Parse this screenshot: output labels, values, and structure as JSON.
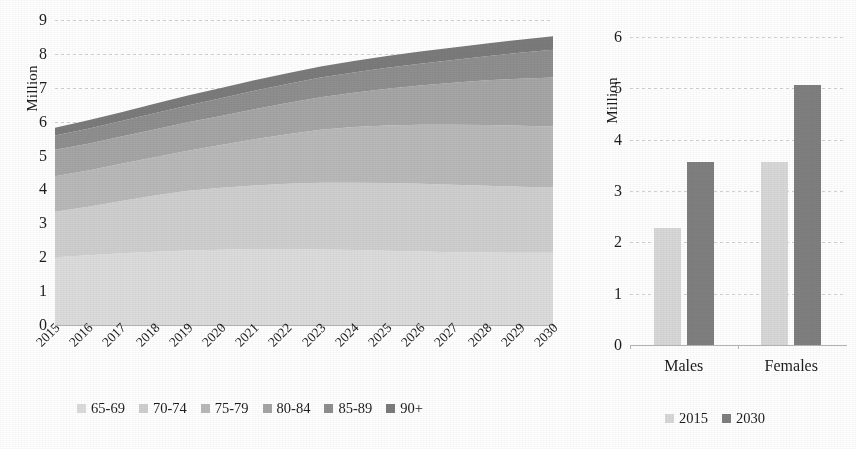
{
  "chart_data": [
    {
      "type": "area",
      "id": "stacked-area-older-population",
      "title": "",
      "xlabel": "",
      "ylabel": "Million",
      "ylim": [
        0,
        9
      ],
      "yticks": [
        0,
        1,
        2,
        3,
        4,
        5,
        6,
        7,
        8,
        9
      ],
      "grid": true,
      "legend_position": "bottom",
      "stacked": true,
      "x": [
        "2015",
        "2016",
        "2017",
        "2018",
        "2019",
        "2020",
        "2021",
        "2022",
        "2023",
        "2024",
        "2025",
        "2026",
        "2027",
        "2028",
        "2029",
        "2030"
      ],
      "series": [
        {
          "name": "65-69",
          "color": "#dcdcdc",
          "values": [
            2.0,
            2.06,
            2.12,
            2.16,
            2.2,
            2.22,
            2.24,
            2.24,
            2.23,
            2.21,
            2.19,
            2.17,
            2.15,
            2.14,
            2.13,
            2.13
          ]
        },
        {
          "name": "70-74",
          "color": "#cfcfcf",
          "values": [
            1.34,
            1.43,
            1.54,
            1.66,
            1.76,
            1.83,
            1.88,
            1.93,
            1.97,
            1.99,
            2.0,
            2.0,
            1.99,
            1.97,
            1.95,
            1.93
          ]
        },
        {
          "name": "75-79",
          "color": "#b9b9b9",
          "values": [
            1.05,
            1.07,
            1.1,
            1.13,
            1.18,
            1.26,
            1.36,
            1.46,
            1.56,
            1.64,
            1.7,
            1.74,
            1.77,
            1.79,
            1.8,
            1.8
          ]
        },
        {
          "name": "80-84",
          "color": "#a6a6a6",
          "values": [
            0.78,
            0.79,
            0.8,
            0.82,
            0.84,
            0.86,
            0.89,
            0.92,
            0.96,
            1.01,
            1.08,
            1.16,
            1.24,
            1.32,
            1.39,
            1.44
          ]
        },
        {
          "name": "85-89",
          "color": "#8f8f8f",
          "values": [
            0.42,
            0.44,
            0.46,
            0.48,
            0.5,
            0.52,
            0.54,
            0.56,
            0.58,
            0.6,
            0.62,
            0.64,
            0.67,
            0.71,
            0.76,
            0.82
          ]
        },
        {
          "name": "90+",
          "color": "#7b7b7b",
          "values": [
            0.23,
            0.25,
            0.26,
            0.28,
            0.29,
            0.3,
            0.31,
            0.32,
            0.33,
            0.34,
            0.35,
            0.36,
            0.37,
            0.38,
            0.39,
            0.4
          ]
        }
      ],
      "totals": [
        5.82,
        6.04,
        6.28,
        6.53,
        6.77,
        6.99,
        7.22,
        7.43,
        7.63,
        7.79,
        7.94,
        8.07,
        8.19,
        8.31,
        8.42,
        8.52
      ]
    },
    {
      "type": "bar",
      "id": "grouped-bar-sex",
      "title": "",
      "xlabel": "",
      "ylabel": "Million",
      "ylim": [
        0,
        6
      ],
      "yticks": [
        0,
        1,
        2,
        3,
        4,
        5,
        6
      ],
      "grid": true,
      "legend_position": "bottom",
      "categories": [
        "Males",
        "Females"
      ],
      "series": [
        {
          "name": "2015",
          "color": "#d8d8d8",
          "values": [
            2.27,
            3.57
          ]
        },
        {
          "name": "2030",
          "color": "#7f7f7f",
          "values": [
            3.56,
            5.06
          ]
        }
      ]
    }
  ],
  "area_panel": {
    "y_axis_title": "Million",
    "y_ticks": [
      "9",
      "8",
      "7",
      "6",
      "5",
      "4",
      "3",
      "2",
      "1",
      "0"
    ],
    "x_ticks": [
      "2015",
      "2016",
      "2017",
      "2018",
      "2019",
      "2020",
      "2021",
      "2022",
      "2023",
      "2024",
      "2025",
      "2026",
      "2027",
      "2028",
      "2029",
      "2030"
    ],
    "legend": [
      {
        "label": "65-69",
        "color": "#dcdcdc"
      },
      {
        "label": "70-74",
        "color": "#cfcfcf"
      },
      {
        "label": "75-79",
        "color": "#b9b9b9"
      },
      {
        "label": "80-84",
        "color": "#a6a6a6"
      },
      {
        "label": "85-89",
        "color": "#8f8f8f"
      },
      {
        "label": "90+",
        "color": "#7b7b7b"
      }
    ]
  },
  "bar_panel": {
    "y_axis_title": "Million",
    "y_ticks": [
      "6",
      "5",
      "4",
      "3",
      "2",
      "1",
      "0"
    ],
    "x_ticks": [
      "Males",
      "Females"
    ],
    "legend": [
      {
        "label": "2015",
        "color": "#d8d8d8"
      },
      {
        "label": "2030",
        "color": "#7f7f7f"
      }
    ]
  }
}
